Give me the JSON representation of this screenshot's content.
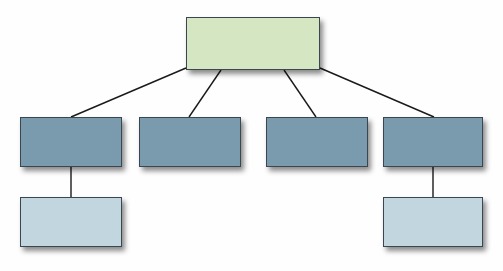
{
  "diagram": {
    "type": "org-chart",
    "colors": {
      "root": "#d5e6c3",
      "level1": "#7a9aad",
      "level2": "#c1d6df",
      "connector": "#1a1a1a",
      "border": "#3a4650"
    },
    "nodes": [
      {
        "id": "root",
        "level": 0,
        "label": "",
        "x": 186,
        "y": 17,
        "w": 134,
        "h": 53
      },
      {
        "id": "child-1",
        "level": 1,
        "label": "",
        "x": 20,
        "y": 117,
        "w": 102,
        "h": 50
      },
      {
        "id": "child-2",
        "level": 1,
        "label": "",
        "x": 139,
        "y": 117,
        "w": 102,
        "h": 50
      },
      {
        "id": "child-3",
        "level": 1,
        "label": "",
        "x": 266,
        "y": 117,
        "w": 102,
        "h": 50
      },
      {
        "id": "child-4",
        "level": 1,
        "label": "",
        "x": 383,
        "y": 117,
        "w": 100,
        "h": 50
      },
      {
        "id": "grandchild-1",
        "level": 2,
        "label": "",
        "x": 20,
        "y": 197,
        "w": 102,
        "h": 50
      },
      {
        "id": "grandchild-4",
        "level": 2,
        "label": "",
        "x": 383,
        "y": 197,
        "w": 100,
        "h": 50
      }
    ],
    "edges": [
      {
        "from": "root",
        "to": "child-1",
        "x1": 186,
        "y1": 68,
        "x2": 71,
        "y2": 117
      },
      {
        "from": "root",
        "to": "child-2",
        "x1": 221,
        "y1": 70,
        "x2": 189,
        "y2": 117
      },
      {
        "from": "root",
        "to": "child-3",
        "x1": 284,
        "y1": 70,
        "x2": 316,
        "y2": 117
      },
      {
        "from": "root",
        "to": "child-4",
        "x1": 320,
        "y1": 68,
        "x2": 434,
        "y2": 117
      },
      {
        "from": "child-1",
        "to": "grandchild-1",
        "x1": 71,
        "y1": 167,
        "x2": 71,
        "y2": 197
      },
      {
        "from": "child-4",
        "to": "grandchild-4",
        "x1": 433,
        "y1": 167,
        "x2": 433,
        "y2": 197
      }
    ]
  }
}
